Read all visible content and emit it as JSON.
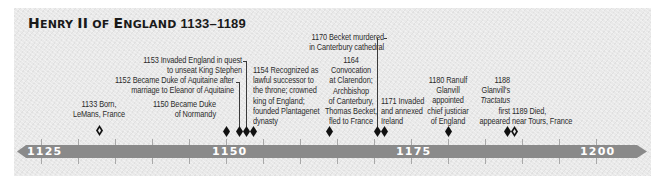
{
  "title": {
    "name_first": "H",
    "name_rest": "ENRY ",
    "roman": "II",
    "of_first": " ",
    "of": "OF ",
    "eng_first": "E",
    "eng_rest": "NGLAND",
    "years": "1133–1189"
  },
  "colors": {
    "background_panel": "#e9e9e9",
    "timeline_bar": "#8a8a8a",
    "axis_label": "#ffffff",
    "marker": "#111111",
    "text": "#2c2c2c"
  },
  "axis": {
    "labels": [
      "1125",
      "1150",
      "1175",
      "1200"
    ],
    "start_year": 1125,
    "end_year": 1200,
    "tick_interval_years": 5
  },
  "events": [
    {
      "year": 1133,
      "marker": "hollow",
      "lines": [
        "1133 Born,",
        "LeMans, France"
      ]
    },
    {
      "year": 1150,
      "marker": "solid",
      "lines": [
        "1150 Became Duke",
        "of Normandy"
      ]
    },
    {
      "year": 1152,
      "marker": "solid",
      "lines": [
        "1152 Became Duke of Aquitaine after",
        "marriage to Eleanor of Aquitaine"
      ]
    },
    {
      "year": 1153,
      "marker": "solid",
      "lines": [
        "1153 Invaded England in quest",
        "to unseat King Stephen"
      ]
    },
    {
      "year": 1154,
      "marker": "solid",
      "lines": [
        "1154 Recognized as",
        "lawful successor to",
        "the throne; crowned",
        "king of England;",
        "founded Plantagenet",
        "dynasty"
      ]
    },
    {
      "year": 1164,
      "marker": "solid",
      "lines": [
        "1164",
        "Convocation",
        "at Clarendon;",
        "Archbishop",
        "of Canterbury,",
        "Thomas Becket,",
        "fled to France"
      ]
    },
    {
      "year": 1170,
      "marker": "solid",
      "lines": [
        "1170 Becket murdered",
        "in Canterbury cathedral"
      ]
    },
    {
      "year": 1171,
      "marker": "solid",
      "lines": [
        "1171 Invaded",
        "and annexed",
        "Ireland"
      ]
    },
    {
      "year": 1180,
      "marker": "solid",
      "lines": [
        "1180 Ranulf",
        "Glanvill",
        "appointed",
        "chief justiciar",
        "of England"
      ]
    },
    {
      "year": 1188,
      "marker": "solid",
      "lines": [
        "1188",
        "Glanvill's",
        "Tractatus",
        "first",
        "appeared"
      ],
      "italic_line": 2
    },
    {
      "year": 1189,
      "marker": "hollow",
      "lines": [
        "1189 Died,",
        "near Tours, France"
      ]
    }
  ]
}
